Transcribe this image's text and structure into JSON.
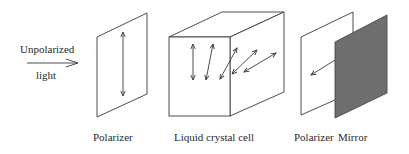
{
  "diagram": {
    "input_label_line1": "Unpolarized",
    "input_label_line2": "light",
    "components": [
      {
        "label": "Polarizer"
      },
      {
        "label": "Liquid crystal cell"
      },
      {
        "label": "Polarizer"
      },
      {
        "label": "Mirror"
      }
    ],
    "colors": {
      "line": "#3a3a3a",
      "mirror_fill": "#6e6e6e"
    }
  }
}
